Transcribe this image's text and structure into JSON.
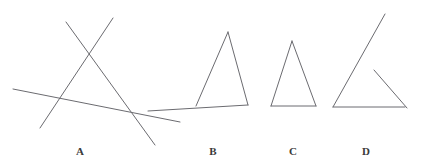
{
  "canvas": {
    "width": 423,
    "height": 168,
    "background_color": "#ffffff",
    "stroke_color": "#6b6b70",
    "stroke_width": 1
  },
  "label_style": {
    "color": "#3a3a3a",
    "font_size_px": 11
  },
  "figures": [
    {
      "id": "figure-a",
      "label": "A",
      "label_x": 80,
      "label_y": 146,
      "description": "three intersecting straight lines forming an open triangle with overshooting ends",
      "shape_type": "open-lines",
      "segments": [
        {
          "name": "left-rising-line",
          "x1": 40,
          "y1": 128,
          "x2": 113,
          "y2": 18
        },
        {
          "name": "right-falling-line",
          "x1": 66,
          "y1": 22,
          "x2": 155,
          "y2": 145
        },
        {
          "name": "base-slanted-line",
          "x1": 13,
          "y1": 89,
          "x2": 180,
          "y2": 122
        }
      ]
    },
    {
      "id": "figure-b",
      "label": "B",
      "label_x": 213,
      "label_y": 146,
      "description": "triangle whose base line extends beyond the left vertex",
      "shape_type": "triangle-with-extended-base",
      "segments": [
        {
          "name": "left-side",
          "x1": 196,
          "y1": 106,
          "x2": 228,
          "y2": 32
        },
        {
          "name": "right-side",
          "x1": 228,
          "y1": 32,
          "x2": 248,
          "y2": 105
        },
        {
          "name": "base-extended",
          "x1": 148,
          "y1": 111,
          "x2": 248,
          "y2": 105
        }
      ]
    },
    {
      "id": "figure-c",
      "label": "C",
      "label_x": 293,
      "label_y": 146,
      "description": "closed isosceles triangle",
      "shape_type": "closed-triangle",
      "segments": [
        {
          "name": "left-side",
          "x1": 271,
          "y1": 106,
          "x2": 292,
          "y2": 41
        },
        {
          "name": "right-side",
          "x1": 292,
          "y1": 41,
          "x2": 316,
          "y2": 106
        },
        {
          "name": "base",
          "x1": 271,
          "y1": 106,
          "x2": 316,
          "y2": 106
        }
      ]
    },
    {
      "id": "figure-d",
      "label": "D",
      "label_x": 366,
      "label_y": 146,
      "description": "open triangle with a gap at the apex and the right side overshooting the base corner",
      "shape_type": "open-triangle",
      "segments": [
        {
          "name": "left-long-line",
          "x1": 333,
          "y1": 107,
          "x2": 385,
          "y2": 14
        },
        {
          "name": "right-short-line",
          "x1": 374,
          "y1": 70,
          "x2": 407,
          "y2": 108
        },
        {
          "name": "base",
          "x1": 333,
          "y1": 107,
          "x2": 405,
          "y2": 107
        }
      ]
    }
  ]
}
